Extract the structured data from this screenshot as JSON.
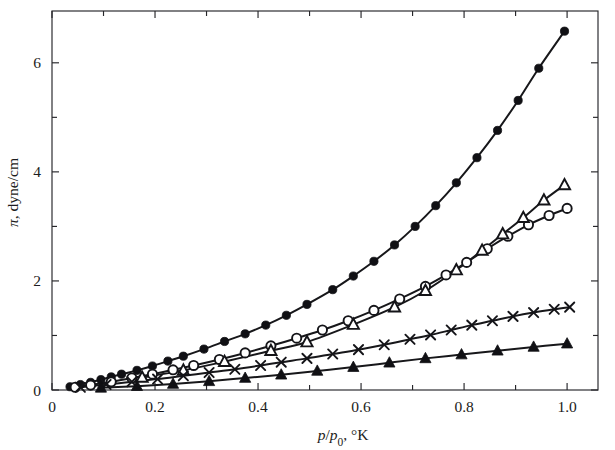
{
  "chart_data": {
    "type": "scatter",
    "title": "",
    "subtitle": "",
    "xlabel": "p/p0, °K",
    "xlabel_parts": {
      "numerator": "p",
      "denominator": "p",
      "subscript": "0",
      "separator": ", ",
      "unit": "°K"
    },
    "ylabel": "π, dyne/cm",
    "ylabel_parts": {
      "symbol": "π",
      "separator": ", ",
      "unit": "dyne/cm"
    },
    "xlim": [
      0,
      1.06
    ],
    "ylim": [
      0,
      6.95
    ],
    "x_major_ticks": [
      0,
      0.2,
      0.4,
      0.6,
      0.8,
      1.0
    ],
    "x_major_ticklabels": [
      "0",
      "0.2",
      "0.4",
      "0.6",
      "0.8",
      "1.0"
    ],
    "x_minor_ticks": [
      0.1,
      0.3,
      0.5,
      0.7,
      0.9
    ],
    "y_major_ticks": [
      0,
      2,
      4,
      6
    ],
    "y_major_ticklabels": [
      "0",
      "2",
      "4",
      "6"
    ],
    "y_minor_ticks": [
      1,
      3,
      5
    ],
    "grid": false,
    "legend": false,
    "legend_position": "none",
    "frame": "box",
    "tick_direction": "in",
    "series": [
      {
        "name": "filled-circle",
        "marker": "filled-circle",
        "color": "#101014",
        "points": [
          [
            0.035,
            0.06
          ],
          [
            0.055,
            0.1
          ],
          [
            0.075,
            0.14
          ],
          [
            0.095,
            0.19
          ],
          [
            0.115,
            0.24
          ],
          [
            0.135,
            0.29
          ],
          [
            0.165,
            0.36
          ],
          [
            0.195,
            0.44
          ],
          [
            0.225,
            0.53
          ],
          [
            0.255,
            0.62
          ],
          [
            0.295,
            0.75
          ],
          [
            0.335,
            0.89
          ],
          [
            0.375,
            1.03
          ],
          [
            0.415,
            1.19
          ],
          [
            0.455,
            1.37
          ],
          [
            0.495,
            1.57
          ],
          [
            0.545,
            1.84
          ],
          [
            0.585,
            2.09
          ],
          [
            0.625,
            2.36
          ],
          [
            0.665,
            2.66
          ],
          [
            0.705,
            3.0
          ],
          [
            0.745,
            3.38
          ],
          [
            0.785,
            3.8
          ],
          [
            0.825,
            4.26
          ],
          [
            0.865,
            4.76
          ],
          [
            0.905,
            5.31
          ],
          [
            0.945,
            5.9
          ],
          [
            0.995,
            6.58
          ]
        ]
      },
      {
        "name": "open-circle",
        "marker": "open-circle",
        "color": "#141418",
        "points": [
          [
            0.045,
            0.05
          ],
          [
            0.075,
            0.09
          ],
          [
            0.115,
            0.15
          ],
          [
            0.155,
            0.22
          ],
          [
            0.195,
            0.29
          ],
          [
            0.235,
            0.37
          ],
          [
            0.275,
            0.45
          ],
          [
            0.325,
            0.56
          ],
          [
            0.375,
            0.68
          ],
          [
            0.425,
            0.81
          ],
          [
            0.475,
            0.95
          ],
          [
            0.525,
            1.1
          ],
          [
            0.575,
            1.27
          ],
          [
            0.625,
            1.46
          ],
          [
            0.675,
            1.67
          ],
          [
            0.725,
            1.9
          ],
          [
            0.765,
            2.11
          ],
          [
            0.805,
            2.34
          ],
          [
            0.845,
            2.59
          ],
          [
            0.885,
            2.82
          ],
          [
            0.925,
            3.03
          ],
          [
            0.965,
            3.2
          ],
          [
            1.0,
            3.33
          ]
        ]
      },
      {
        "name": "open-triangle",
        "marker": "open-triangle",
        "color": "#141418",
        "points": [
          [
            0.175,
            0.23
          ],
          [
            0.255,
            0.36
          ],
          [
            0.335,
            0.52
          ],
          [
            0.425,
            0.72
          ],
          [
            0.495,
            0.88
          ],
          [
            0.585,
            1.2
          ],
          [
            0.665,
            1.52
          ],
          [
            0.725,
            1.82
          ],
          [
            0.785,
            2.2
          ],
          [
            0.835,
            2.56
          ],
          [
            0.875,
            2.86
          ],
          [
            0.915,
            3.16
          ],
          [
            0.955,
            3.48
          ],
          [
            0.995,
            3.76
          ]
        ]
      },
      {
        "name": "cross",
        "marker": "cross",
        "color": "#141418",
        "points": [
          [
            0.055,
            0.05
          ],
          [
            0.105,
            0.1
          ],
          [
            0.155,
            0.15
          ],
          [
            0.205,
            0.2
          ],
          [
            0.255,
            0.26
          ],
          [
            0.305,
            0.32
          ],
          [
            0.355,
            0.38
          ],
          [
            0.405,
            0.45
          ],
          [
            0.445,
            0.51
          ],
          [
            0.495,
            0.58
          ],
          [
            0.545,
            0.66
          ],
          [
            0.595,
            0.74
          ],
          [
            0.645,
            0.83
          ],
          [
            0.695,
            0.93
          ],
          [
            0.735,
            1.01
          ],
          [
            0.775,
            1.1
          ],
          [
            0.815,
            1.19
          ],
          [
            0.855,
            1.27
          ],
          [
            0.895,
            1.35
          ],
          [
            0.935,
            1.42
          ],
          [
            0.975,
            1.48
          ],
          [
            1.005,
            1.52
          ]
        ]
      },
      {
        "name": "filled-triangle",
        "marker": "filled-triangle",
        "color": "#101014",
        "points": [
          [
            0.095,
            0.04
          ],
          [
            0.165,
            0.07
          ],
          [
            0.235,
            0.11
          ],
          [
            0.305,
            0.16
          ],
          [
            0.375,
            0.22
          ],
          [
            0.445,
            0.28
          ],
          [
            0.515,
            0.35
          ],
          [
            0.585,
            0.42
          ],
          [
            0.655,
            0.5
          ],
          [
            0.725,
            0.58
          ],
          [
            0.795,
            0.65
          ],
          [
            0.865,
            0.72
          ],
          [
            0.935,
            0.79
          ],
          [
            1.0,
            0.85
          ]
        ]
      }
    ]
  }
}
